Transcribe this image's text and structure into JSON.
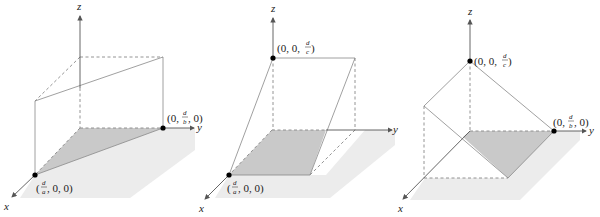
{
  "panels": [
    {
      "id": "plane-parallel-z",
      "axes": {
        "x": "x",
        "y": "y",
        "z": "z"
      },
      "points": [
        {
          "name": "x-intercept",
          "label_pre": "(",
          "num": "d",
          "den": "a",
          "label_post": ", 0, 0)"
        },
        {
          "name": "y-intercept",
          "label_pre": "(0, ",
          "num": "d",
          "den": "b",
          "label_post": ", 0)"
        }
      ]
    },
    {
      "id": "plane-parallel-y",
      "axes": {
        "x": "x",
        "y": "y",
        "z": "z"
      },
      "points": [
        {
          "name": "z-intercept",
          "label_pre": "(0, 0, ",
          "num": "d",
          "den": "c",
          "label_post": ")"
        },
        {
          "name": "x-intercept",
          "label_pre": "(",
          "num": "d",
          "den": "a",
          "label_post": ", 0, 0)"
        }
      ]
    },
    {
      "id": "plane-parallel-x",
      "axes": {
        "x": "x",
        "y": "y",
        "z": "z"
      },
      "points": [
        {
          "name": "z-intercept",
          "label_pre": "(0, 0, ",
          "num": "d",
          "den": "c",
          "label_post": ")"
        },
        {
          "name": "y-intercept",
          "label_pre": "(0, ",
          "num": "d",
          "den": "b",
          "label_post": ", 0)"
        }
      ]
    }
  ],
  "colors": {
    "shade": "#c9c9c9",
    "shadow": "#ececec",
    "axis": "#555555",
    "edge": "#888888"
  }
}
